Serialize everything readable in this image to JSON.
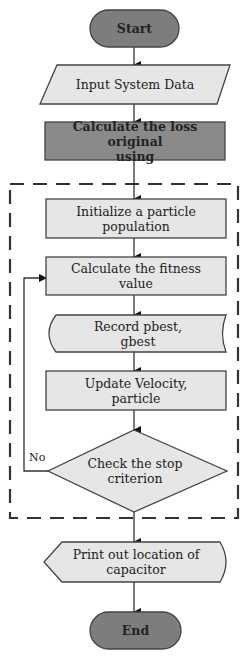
{
  "diagram": {
    "type": "flowchart",
    "nodes": [
      {
        "id": "start",
        "shape": "terminal",
        "label": "Start"
      },
      {
        "id": "input",
        "shape": "parallelogram",
        "label": "Input System Data"
      },
      {
        "id": "calc_loss",
        "shape": "process-dark",
        "label": "Calculate the loss original using"
      },
      {
        "id": "init",
        "shape": "process",
        "label": "Initialize a particle population"
      },
      {
        "id": "fitness",
        "shape": "process",
        "label": "Calculate the fitness value"
      },
      {
        "id": "record",
        "shape": "stored-data",
        "label": "Record pbest, gbest"
      },
      {
        "id": "update",
        "shape": "process",
        "label": "Update Velocity, particle"
      },
      {
        "id": "check",
        "shape": "decision",
        "label": "Check the stop criterion"
      },
      {
        "id": "print",
        "shape": "display",
        "label": "Print out location of capacitor"
      },
      {
        "id": "end",
        "shape": "terminal",
        "label": "End"
      }
    ],
    "edges": [
      {
        "from": "start",
        "to": "input"
      },
      {
        "from": "input",
        "to": "calc_loss"
      },
      {
        "from": "calc_loss",
        "to": "init"
      },
      {
        "from": "init",
        "to": "fitness"
      },
      {
        "from": "fitness",
        "to": "record"
      },
      {
        "from": "record",
        "to": "update"
      },
      {
        "from": "update",
        "to": "check"
      },
      {
        "from": "check",
        "to": "fitness",
        "label": "No"
      },
      {
        "from": "check",
        "to": "print"
      },
      {
        "from": "print",
        "to": "end"
      }
    ],
    "group": {
      "style": "dashed",
      "contains": [
        "init",
        "fitness",
        "record",
        "update",
        "check"
      ]
    }
  },
  "labels": {
    "start": "Start",
    "input_line1": "Input System Data",
    "calc_line1": "Calculate the loss original",
    "calc_line2": "using",
    "init_line1": "Initialize a particle",
    "init_line2": "population",
    "fitness_line1": "Calculate the fitness",
    "fitness_line2": "value",
    "record_line1": "Record pbest,",
    "record_line2": "gbest",
    "update_line1": "Update Velocity,",
    "update_line2": "particle",
    "check_line1": "Check the stop",
    "check_line2": "criterion",
    "print_line1": "Print out location of",
    "print_line2": "capacitor",
    "end": "End",
    "no": "No"
  },
  "colors": {
    "terminal_fill": "#7d7d7d",
    "dark_process_fill": "#8a8a8a",
    "light_fill": "#e6e6e6",
    "stroke": "#444444"
  }
}
